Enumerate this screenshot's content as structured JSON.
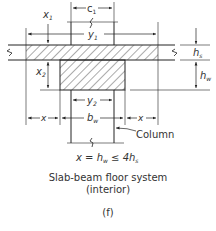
{
  "diagram": {
    "labels": {
      "c1": "c",
      "c1_sub": "1",
      "x1": "x",
      "x1_sub": "1",
      "y1": "y",
      "y1_sub": "1",
      "x2": "x",
      "x2_sub": "2",
      "y2": "y",
      "y2_sub": "2",
      "hs": "h",
      "hs_sub": "s",
      "hw": "h",
      "hw_sub": "w",
      "bw": "b",
      "bw_sub": "w",
      "x_left": "x",
      "x_right": "x",
      "column": "Column"
    },
    "formula": {
      "lhs": "x = h",
      "lhs_sub": "w",
      "rel": " ≤ 4h",
      "rel_sub": "s"
    },
    "caption": {
      "line1": "Slab-beam floor system",
      "line2": "(interior)",
      "figure_label": "(f)"
    },
    "colors": {
      "line": "#222222",
      "hatch": "#444444",
      "text": "#333333"
    }
  }
}
